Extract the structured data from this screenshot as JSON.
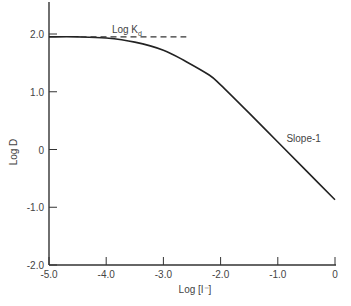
{
  "chart_data": {
    "type": "line",
    "title": "",
    "xlabel": "Log [I⁻]",
    "ylabel": "Log D",
    "xlim": [
      -5.0,
      0
    ],
    "ylim": [
      -2.0,
      2.5
    ],
    "grid": false,
    "x_ticks": [
      "-5.0",
      "-4.0",
      "-3.0",
      "-2.0",
      "-1.0",
      "0"
    ],
    "y_ticks": [
      "2.0",
      "1.0",
      "0",
      "-1.0",
      "-2.0"
    ],
    "series": [
      {
        "name": "Log D",
        "style": "solid",
        "x": [
          -5.0,
          -4.5,
          -4.0,
          -3.5,
          -3.0,
          -2.6,
          -2.2,
          -2.0,
          -1.5,
          -1.0,
          -0.5,
          0
        ],
        "y": [
          1.95,
          1.95,
          1.93,
          1.86,
          1.72,
          1.52,
          1.29,
          1.12,
          0.63,
          0.13,
          -0.37,
          -0.87
        ]
      },
      {
        "name": "Log Kd",
        "style": "dashed",
        "x": [
          -4.45,
          -2.6
        ],
        "y": [
          1.95,
          1.95
        ]
      }
    ],
    "annotations": [
      {
        "text": "Log K",
        "subscript": "d",
        "x": -3.9,
        "y": 2.05
      },
      {
        "text": "Slope-1",
        "x": -0.85,
        "y": 0.35
      }
    ]
  }
}
